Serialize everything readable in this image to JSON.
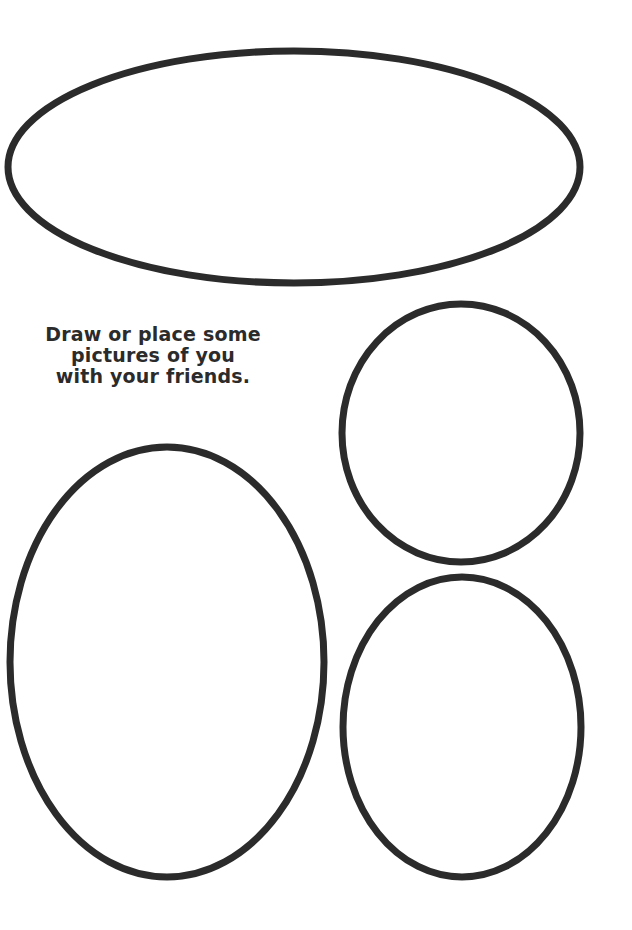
{
  "page": {
    "background": "#ffffff",
    "stroke_color": "#2b2b2b"
  },
  "prompt": {
    "lines": [
      "Draw or place some",
      "pictures of you",
      "with your friends."
    ]
  },
  "frames": [
    {
      "id": "top-wide-oval",
      "cx": 294,
      "cy": 167,
      "rx": 286,
      "ry": 116
    },
    {
      "id": "top-right-oval",
      "cx": 461,
      "cy": 433,
      "rx": 119,
      "ry": 129
    },
    {
      "id": "large-left-oval",
      "cx": 167,
      "cy": 662,
      "rx": 157,
      "ry": 215
    },
    {
      "id": "bottom-right-oval",
      "cx": 462,
      "cy": 727,
      "rx": 119,
      "ry": 150
    }
  ]
}
